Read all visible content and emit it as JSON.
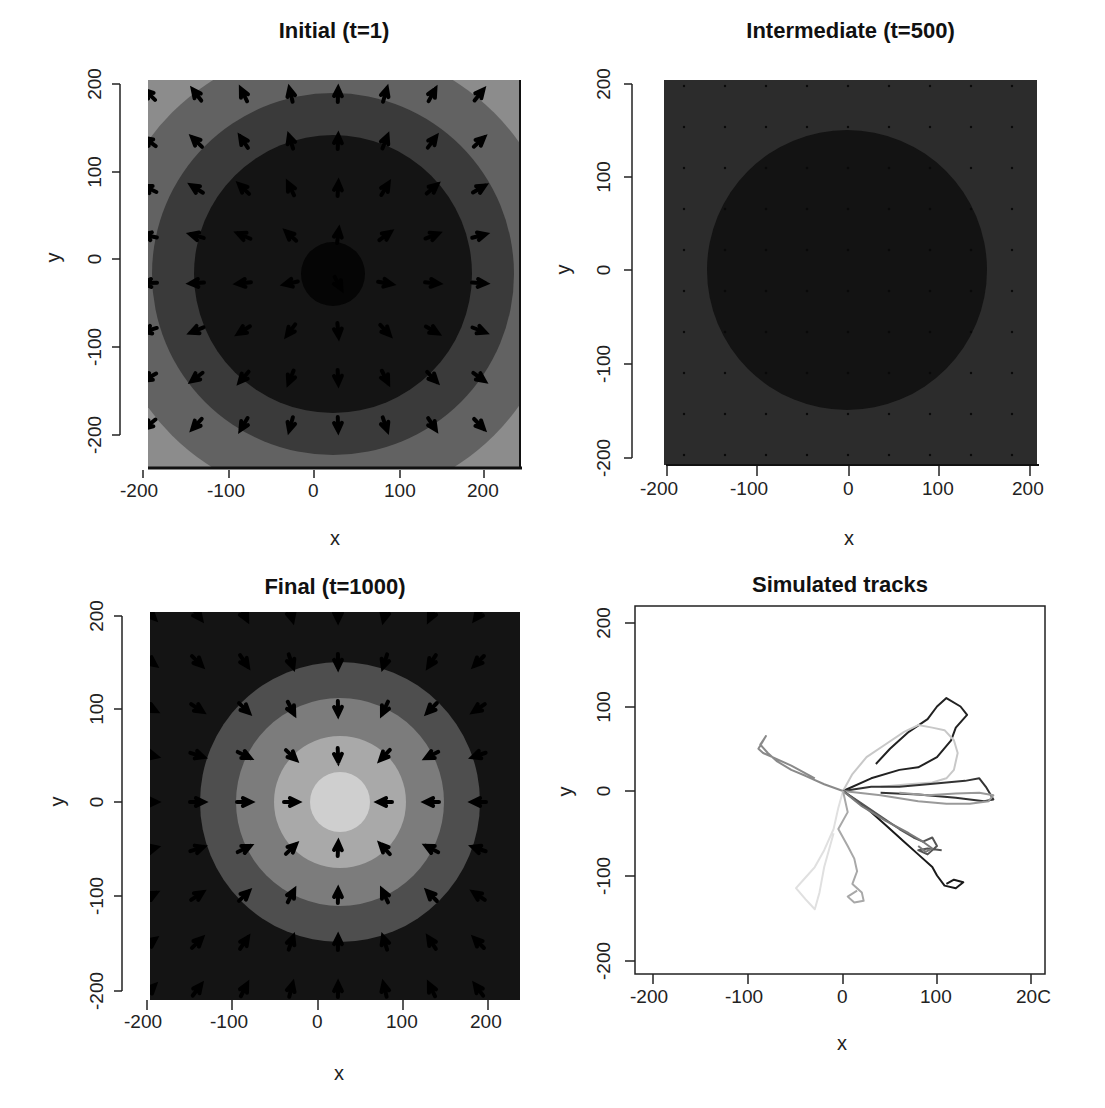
{
  "chart_data": [
    {
      "type": "heatmap",
      "title": "Initial (t=1)",
      "xlabel": "x",
      "ylabel": "y",
      "xlim": [
        -200,
        200
      ],
      "ylim": [
        -200,
        200
      ],
      "xticks": [
        "-200",
        "-100",
        "0",
        "100",
        "200"
      ],
      "yticks": [
        "-200",
        "-100",
        "0",
        "100",
        "200"
      ],
      "grid": false,
      "description": "Concentric grayscale bands centred at (0,0); darkest at centre, lighter toward corners; arrow field pointing outward from centre",
      "bands": [
        {
          "radius": 35,
          "color": "#050505"
        },
        {
          "radius": 150,
          "color": "#141414"
        },
        {
          "radius": 195,
          "color": "#3a3a3a"
        },
        {
          "radius": 245,
          "color": "#626262"
        },
        {
          "radius": 300,
          "color": "#8c8c8c"
        }
      ],
      "vector_field": {
        "spacing": 45,
        "direction": "outward"
      }
    },
    {
      "type": "heatmap",
      "title": "Intermediate (t=500)",
      "xlabel": "x",
      "ylabel": "y",
      "xlim": [
        -200,
        200
      ],
      "ylim": [
        -200,
        200
      ],
      "xticks": [
        "-200",
        "-100",
        "0",
        "100",
        "200"
      ],
      "yticks": [
        "-200",
        "-100",
        "0",
        "100",
        "200"
      ],
      "grid": false,
      "description": "Nearly uniform dark field with a slightly darker disc of radius ~150 centred at (0,0); tiny dot markers on a regular grid",
      "bands": [
        {
          "radius": 150,
          "color": "#121212"
        },
        {
          "radius": 300,
          "color": "#2c2c2c"
        }
      ],
      "vector_field": {
        "spacing": 45,
        "direction": "negligible"
      }
    },
    {
      "type": "heatmap",
      "title": "Final (t=1000)",
      "xlabel": "x",
      "ylabel": "y",
      "xlim": [
        -200,
        200
      ],
      "ylim": [
        -200,
        200
      ],
      "xticks": [
        "-200",
        "-100",
        "0",
        "100",
        "200"
      ],
      "yticks": [
        "-200",
        "-100",
        "0",
        "100",
        "200"
      ],
      "grid": false,
      "description": "Concentric grayscale bands centred at (0,0); lightest at centre, darkening outward; arrow field pointing inward to centre",
      "bands": [
        {
          "radius": 33,
          "color": "#cfcfcf"
        },
        {
          "radius": 72,
          "color": "#a9a9a9"
        },
        {
          "radius": 112,
          "color": "#7c7c7c"
        },
        {
          "radius": 152,
          "color": "#4e4e4e"
        },
        {
          "radius": 300,
          "color": "#141414"
        }
      ],
      "vector_field": {
        "spacing": 45,
        "direction": "inward"
      }
    },
    {
      "type": "line",
      "title": "Simulated tracks",
      "xlabel": "x",
      "ylabel": "y",
      "xlim": [
        -220,
        215
      ],
      "ylim": [
        -215,
        220
      ],
      "xticks": [
        "-200",
        "-100",
        "0",
        "100",
        "200"
      ],
      "yticks": [
        "-200",
        "-100",
        "0",
        "100",
        "200"
      ],
      "grid": false,
      "description": "Ten random-walk tracks starting at the origin, drawn in varying grey shades",
      "series": [
        {
          "name": "track-1",
          "color": "#222222",
          "x": [
            0,
            30,
            60,
            80,
            100,
            115,
            120,
            132,
            125,
            110,
            100,
            90,
            70,
            50,
            35
          ],
          "y": [
            0,
            15,
            25,
            28,
            40,
            60,
            75,
            90,
            100,
            110,
            100,
            85,
            70,
            50,
            32
          ]
        },
        {
          "name": "track-2",
          "color": "#c8c8c8",
          "x": [
            0,
            10,
            25,
            45,
            65,
            80,
            95,
            108,
            118,
            122,
            118,
            110,
            95,
            70,
            40
          ],
          "y": [
            0,
            20,
            40,
            55,
            70,
            78,
            75,
            72,
            60,
            45,
            25,
            15,
            10,
            8,
            5
          ]
        },
        {
          "name": "track-3",
          "color": "#333333",
          "x": [
            0,
            30,
            60,
            90,
            110,
            130,
            145,
            152,
            160,
            150,
            120,
            80,
            40
          ],
          "y": [
            0,
            5,
            5,
            8,
            10,
            12,
            15,
            5,
            -10,
            -12,
            -8,
            -4,
            -2
          ]
        },
        {
          "name": "track-4",
          "color": "#9a9a9a",
          "x": [
            0,
            40,
            80,
            110,
            135,
            155,
            160,
            145,
            120,
            90,
            60
          ],
          "y": [
            0,
            -5,
            -12,
            -15,
            -15,
            -12,
            -5,
            -2,
            -3,
            -5,
            -2
          ]
        },
        {
          "name": "track-5",
          "color": "#1a1a1a",
          "x": [
            0,
            25,
            45,
            65,
            80,
            95,
            100,
            108,
            120,
            128,
            118,
            110
          ],
          "y": [
            0,
            -20,
            -40,
            -60,
            -75,
            -90,
            -100,
            -112,
            -115,
            -108,
            -105,
            -110
          ]
        },
        {
          "name": "track-6",
          "color": "#555555",
          "x": [
            0,
            20,
            40,
            60,
            75,
            85,
            95,
            100,
            90,
            80,
            90,
            105
          ],
          "y": [
            0,
            -15,
            -30,
            -45,
            -55,
            -60,
            -55,
            -65,
            -75,
            -70,
            -68,
            -70
          ]
        },
        {
          "name": "track-7",
          "color": "#7a7a7a",
          "x": [
            0,
            20,
            45,
            70,
            85,
            95,
            88,
            80
          ],
          "y": [
            0,
            -18,
            -35,
            -50,
            -60,
            -68,
            -72,
            -65
          ]
        },
        {
          "name": "track-8",
          "color": "#8a8a8a",
          "x": [
            0,
            -20,
            -40,
            -55,
            -70,
            -80,
            -88,
            -82,
            -90,
            -85,
            -75,
            -55,
            -30
          ],
          "y": [
            0,
            8,
            18,
            25,
            35,
            45,
            55,
            65,
            50,
            45,
            40,
            30,
            15
          ]
        },
        {
          "name": "track-9",
          "color": "#e0e0e0",
          "x": [
            0,
            -5,
            -10,
            -20,
            -30,
            -42,
            -50,
            -40,
            -30,
            -25,
            -20,
            -10
          ],
          "y": [
            0,
            -20,
            -45,
            -70,
            -90,
            -105,
            -115,
            -128,
            -140,
            -120,
            -90,
            -50
          ]
        },
        {
          "name": "track-10",
          "color": "#a8a8a8",
          "x": [
            0,
            5,
            -5,
            5,
            12,
            15,
            10,
            20,
            22,
            12,
            5,
            15
          ],
          "y": [
            0,
            -25,
            -45,
            -65,
            -80,
            -95,
            -110,
            -120,
            -130,
            -132,
            -125,
            -118
          ]
        }
      ]
    }
  ],
  "panels": {
    "initial": {
      "title": "Initial (t=1)",
      "xlabel": "x",
      "ylabel": "y"
    },
    "intermediate": {
      "title": "Intermediate (t=500)",
      "xlabel": "x",
      "ylabel": "y"
    },
    "final": {
      "title": "Final (t=1000)",
      "xlabel": "x",
      "ylabel": "y"
    },
    "tracks": {
      "title": "Simulated tracks",
      "xlabel": "x",
      "ylabel": "y"
    }
  },
  "ticks": {
    "x": [
      "-200",
      "-100",
      "0",
      "100",
      "200"
    ],
    "y": [
      "-200",
      "-100",
      "0",
      "100",
      "200"
    ],
    "x_truncated_last": "20C"
  }
}
